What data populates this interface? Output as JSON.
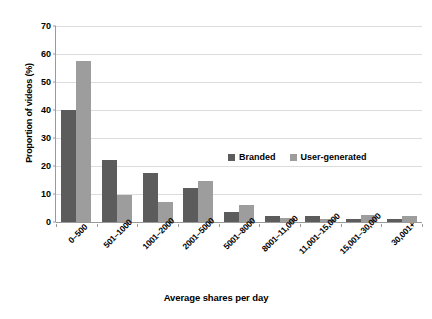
{
  "chart_data": {
    "type": "bar",
    "title": "",
    "xlabel": "Average shares per day",
    "ylabel": "Proportion of videos (%)",
    "categories": [
      "0–500",
      "501–1000",
      "1001–2000",
      "2001–5000",
      "5001–8000",
      "8001–11,000",
      "11,001–15,000",
      "15,001–30,000",
      "30,001+"
    ],
    "series": [
      {
        "name": "Branded",
        "color": "#5c5c5c",
        "values": [
          40,
          22,
          17.5,
          12,
          3.5,
          2,
          2,
          1,
          1
        ]
      },
      {
        "name": "User-generated",
        "color": "#9d9d9d",
        "values": [
          57.5,
          9.5,
          7,
          14.5,
          6,
          1.5,
          1,
          2.5,
          2
        ]
      }
    ],
    "ylim": [
      0,
      70
    ],
    "yticks": [
      0,
      10,
      20,
      30,
      40,
      50,
      60,
      70
    ],
    "ytick_labels": [
      "0",
      "10",
      "20",
      "30",
      "40",
      "50",
      "60",
      "70"
    ],
    "grid": true,
    "legend_position": "inside-upper-right"
  },
  "legend": {
    "items": [
      {
        "label": "Branded",
        "color": "#5c5c5c"
      },
      {
        "label": "User-generated",
        "color": "#9d9d9d"
      }
    ]
  }
}
